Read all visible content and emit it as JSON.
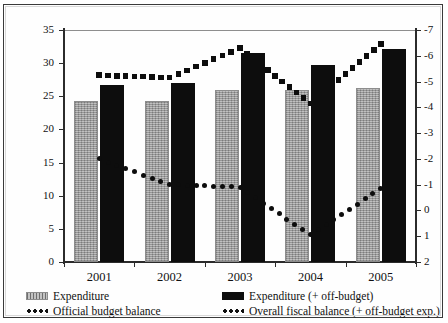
{
  "chart_data": {
    "type": "bar",
    "title": "",
    "xlabel": "",
    "ylabel": "",
    "categories": [
      "2001",
      "2002",
      "2003",
      "2004",
      "2005"
    ],
    "left_axis": {
      "ylim": [
        0,
        35
      ],
      "ticks": [
        0,
        5,
        10,
        15,
        20,
        25,
        30,
        35
      ],
      "tick_labels": [
        "0",
        "5",
        "10",
        "15",
        "20",
        "25",
        "30",
        "35"
      ]
    },
    "right_axis": {
      "ylim": [
        -7,
        2
      ],
      "inverted": true,
      "ticks": [
        -7,
        -6,
        -5,
        -4,
        -3,
        -2,
        -1,
        0,
        1,
        2
      ],
      "tick_labels": [
        "-7",
        "-6",
        "-5",
        "-4",
        "-3",
        "-2",
        "-1",
        "0",
        "1",
        "2"
      ]
    },
    "grid": false,
    "legend_position": "bottom",
    "series": [
      {
        "name": "Expenditure",
        "kind": "bar",
        "color": "#a9a9a9",
        "axis": "left",
        "values": [
          24.3,
          24.3,
          26.0,
          26.0,
          26.2
        ]
      },
      {
        "name": "Expenditure (+ off-budget)",
        "kind": "bar",
        "color": "#0d0d0d",
        "axis": "left",
        "values": [
          26.7,
          27.0,
          31.5,
          29.7,
          32.2
        ]
      },
      {
        "name": "Official budget balance",
        "kind": "dotted-line",
        "color": "#0d0d0d",
        "axis": "right",
        "values": [
          -2.0,
          -1.0,
          -0.9,
          0.95,
          -0.85
        ]
      },
      {
        "name": "Overall fiscal balance  (+ off-budget exp.)",
        "kind": "dotted-line",
        "color": "#0d0d0d",
        "axis": "right",
        "values": [
          -5.25,
          -5.15,
          -6.3,
          -4.15,
          -6.45
        ]
      }
    ]
  },
  "legend": {
    "items": [
      {
        "label": "Expenditure",
        "marker": "grey-swatch"
      },
      {
        "label": "Expenditure (+ off-budget)",
        "marker": "black-swatch"
      },
      {
        "label": "Official budget balance",
        "marker": "dotted-swatch"
      },
      {
        "label": "Overall fiscal balance  (+ off-budget exp.)",
        "marker": "dotted-swatch"
      }
    ]
  }
}
